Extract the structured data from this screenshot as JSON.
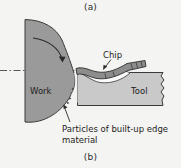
{
  "figure": {
    "panel_top_label": "(a)",
    "panel_bottom_label": "(b)",
    "background_color": "#f4f4f2"
  },
  "labels": {
    "work": "Work",
    "tool": "Tool",
    "chip": "Chip",
    "built_up_edge_caption": "Particles of built-up edge material"
  },
  "colors": {
    "work_fill": "#9a9a9a",
    "tool_fill": "#c9c9c9",
    "chip_fill": "#8d8d8d",
    "outline": "#3a3a3a",
    "text": "#1d1d1d",
    "centerline": "#444444"
  },
  "icons": {
    "rotation_arrow": "curved-rotation-arrow",
    "chip_leader": "leader-arrow",
    "bue_leader": "leader-arrow",
    "centerline": "dash-dot-centerline",
    "break_line": "zigzag-break-line"
  }
}
